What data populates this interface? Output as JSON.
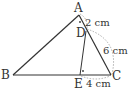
{
  "figure": {
    "points": {
      "A": {
        "label": "A",
        "x": 79,
        "y": 15
      },
      "B": {
        "label": "B",
        "x": 13,
        "y": 75
      },
      "C": {
        "label": "C",
        "x": 111,
        "y": 75
      },
      "D": {
        "label": "D",
        "x": 86,
        "y": 31
      },
      "E": {
        "label": "E",
        "x": 80,
        "y": 75
      }
    },
    "measurements": {
      "AD": "2 cm",
      "DC": "6 cm",
      "EC": "4 cm"
    },
    "colors": {
      "line": "#333333",
      "arc": "#999999"
    }
  }
}
